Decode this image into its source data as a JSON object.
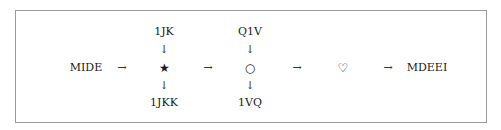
{
  "diagram": {
    "start": "MIDE",
    "end": "MDEEI",
    "arrow_right": "→",
    "arrow_down": "↓",
    "steps": [
      {
        "symbol": "★",
        "name": "star",
        "input": "1JK",
        "output": "1JKK"
      },
      {
        "symbol": "○",
        "name": "circle",
        "input": "Q1V",
        "output": "1VQ"
      },
      {
        "symbol": "♡",
        "name": "heart"
      }
    ]
  }
}
